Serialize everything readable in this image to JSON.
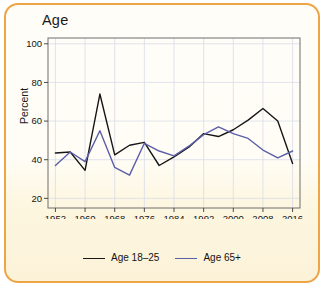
{
  "card": {
    "border_color": "#eda545",
    "background_color": "#fffdf8"
  },
  "chart": {
    "title": "Age",
    "ylabel": "Percent"
  },
  "legend": {
    "position": "bottom-center",
    "entries": [
      {
        "label": "Age 18–25",
        "color": "#161616"
      },
      {
        "label": "Age 65+",
        "color": "#5b5fa8"
      }
    ]
  },
  "chart_data": {
    "type": "line",
    "title": "Age",
    "xlabel": "",
    "ylabel": "Percent",
    "grid": true,
    "xlim": [
      1950,
      2018
    ],
    "ylim": [
      15,
      103
    ],
    "ytick_labels": [
      "20",
      "40",
      "60",
      "80",
      "100"
    ],
    "yticks": [
      20,
      40,
      60,
      80,
      100
    ],
    "xtick_labels": [
      "1952",
      "1960",
      "1968",
      "1976",
      "1984",
      "1992",
      "2000",
      "2008",
      "2016"
    ],
    "xticks": [
      1952,
      1960,
      1968,
      1976,
      1984,
      1992,
      2000,
      2008,
      2016
    ],
    "x": [
      1952,
      1956,
      1960,
      1964,
      1968,
      1972,
      1976,
      1980,
      1984,
      1988,
      1992,
      1996,
      2000,
      2004,
      2008,
      2012,
      2016
    ],
    "series": [
      {
        "name": "Age 18–25",
        "color": "#161616",
        "values": [
          43.5,
          44,
          34.5,
          74,
          42.5,
          47.5,
          49,
          37,
          41.5,
          46.5,
          53.5,
          52,
          55.5,
          60.5,
          66.5,
          60,
          38
        ]
      },
      {
        "name": "Age 65+",
        "color": "#5b5fa8",
        "values": [
          37,
          44,
          39,
          55,
          36,
          32,
          48.5,
          44.5,
          42,
          47,
          53,
          57,
          53.5,
          51,
          45,
          41,
          44.5
        ]
      }
    ]
  }
}
